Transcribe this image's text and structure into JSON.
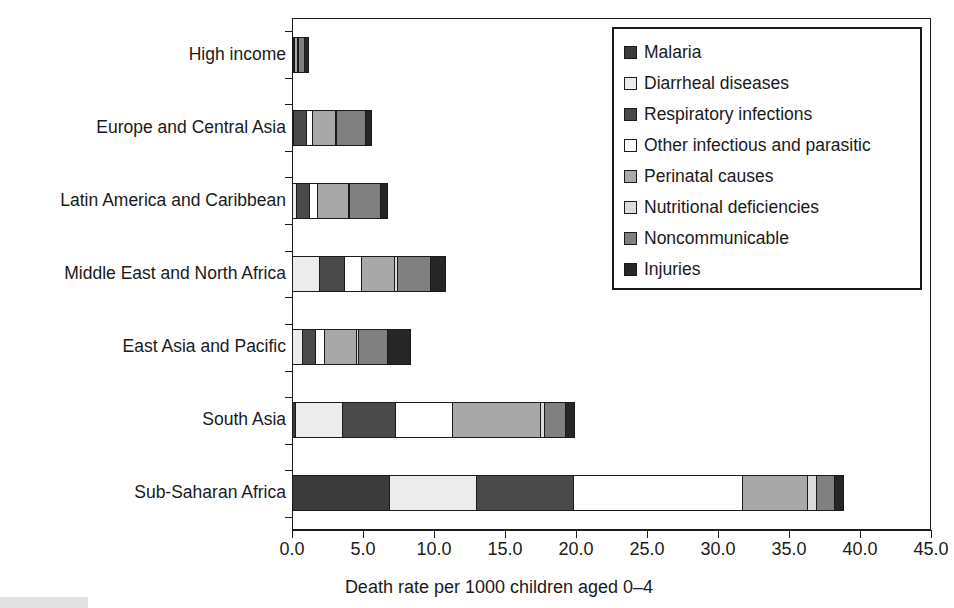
{
  "chart_data": {
    "type": "bar",
    "orientation": "horizontal",
    "stacked": true,
    "title": "",
    "xlabel": "Death rate per 1000 children aged 0–4",
    "ylabel": "",
    "xlim": [
      0,
      45
    ],
    "xticks": [
      0.0,
      5.0,
      10.0,
      15.0,
      20.0,
      25.0,
      30.0,
      35.0,
      40.0,
      45.0
    ],
    "xtick_labels": [
      "0.0",
      "5.0",
      "10.0",
      "15.0",
      "20.0",
      "25.0",
      "30.0",
      "35.0",
      "40.0",
      "45.0"
    ],
    "grid": false,
    "legend_position": "upper right",
    "categories": [
      "High income",
      "Europe and Central Asia",
      "Latin America and Caribbean",
      "Middle East and North Africa",
      "East Asia and Pacific",
      "South Asia",
      "Sub-Saharan Africa"
    ],
    "series": [
      {
        "name": "Malaria",
        "color": "#3b3b3b",
        "values": [
          0.0,
          0.0,
          0.0,
          0.0,
          0.0,
          0.25,
          6.9
        ]
      },
      {
        "name": "Diarrheal diseases",
        "color": "#ececec",
        "values": [
          0.0,
          0.1,
          0.35,
          2.0,
          0.75,
          3.4,
          6.2
        ]
      },
      {
        "name": "Respiratory infections",
        "color": "#4a4a4a",
        "values": [
          0.1,
          1.0,
          1.0,
          1.8,
          1.0,
          3.8,
          6.9
        ]
      },
      {
        "name": "Other infectious and parasitic",
        "color": "#ffffff",
        "values": [
          0.1,
          0.5,
          0.6,
          1.3,
          0.75,
          4.1,
          12.0
        ]
      },
      {
        "name": "Perinatal causes",
        "color": "#a8a8a8",
        "values": [
          0.3,
          1.7,
          2.3,
          2.4,
          2.3,
          6.3,
          4.6
        ]
      },
      {
        "name": "Nutritional deficiencies",
        "color": "#dcdcdc",
        "values": [
          0.05,
          0.1,
          0.15,
          0.25,
          0.2,
          0.35,
          0.7
        ]
      },
      {
        "name": "Noncommunicable",
        "color": "#808080",
        "values": [
          0.5,
          2.1,
          2.2,
          2.4,
          2.1,
          1.5,
          1.4
        ]
      },
      {
        "name": "Injuries",
        "color": "#262626",
        "values": [
          0.35,
          0.5,
          0.6,
          1.1,
          1.7,
          0.7,
          0.7
        ]
      }
    ],
    "totals": [
      1.4,
      6.0,
      7.2,
      11.25,
      8.8,
      20.4,
      39.4
    ]
  },
  "legend": {
    "items": [
      {
        "label": "Malaria",
        "swatch": "#3b3b3b"
      },
      {
        "label": "Diarrheal diseases",
        "swatch": "#ececec"
      },
      {
        "label": "Respiratory infections",
        "swatch": "#4a4a4a"
      },
      {
        "label": "Other infectious and parasitic",
        "swatch": "#ffffff"
      },
      {
        "label": "Perinatal causes",
        "swatch": "#a8a8a8"
      },
      {
        "label": "Nutritional deficiencies",
        "swatch": "#dcdcdc"
      },
      {
        "label": "Noncommunicable",
        "swatch": "#808080"
      },
      {
        "label": "Injuries",
        "swatch": "#262626"
      }
    ]
  }
}
